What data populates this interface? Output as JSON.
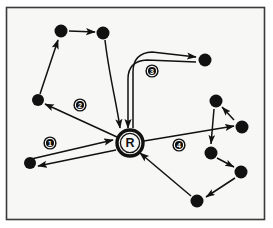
{
  "figure": {
    "type": "node-link-diagram",
    "background_color": "#f7f7f5",
    "border_color": "#3a3a3a",
    "stroke_color": "#111111",
    "node_fill": "#111111",
    "label_fill": "#111111",
    "label_text_color": "#ffffff",
    "width": 273,
    "height": 228
  },
  "depot": {
    "label": "R",
    "name": "depot-node",
    "x": 130,
    "y": 143,
    "outer_radius": 13,
    "inner_radius": 9.5
  },
  "route_labels": [
    {
      "id": "route-label-1",
      "text": "1",
      "x": 50,
      "y": 143
    },
    {
      "id": "route-label-2",
      "text": "2",
      "x": 80,
      "y": 105
    },
    {
      "id": "route-label-3",
      "text": "3",
      "x": 152,
      "y": 71
    },
    {
      "id": "route-label-4",
      "text": "4",
      "x": 179,
      "y": 145
    }
  ],
  "nodes": [
    {
      "id": "n1",
      "name": "customer-node-bottom-left",
      "x": 30,
      "y": 163,
      "r": 6.0,
      "route": 1
    },
    {
      "id": "n2",
      "name": "customer-node-left-middle",
      "x": 38,
      "y": 100,
      "r": 6.0,
      "route": 2
    },
    {
      "id": "n3",
      "name": "customer-node-top-left",
      "x": 61,
      "y": 31,
      "r": 6.5,
      "route": 2
    },
    {
      "id": "n4",
      "name": "customer-node-top-center",
      "x": 103,
      "y": 33,
      "r": 6.5,
      "route": 2
    },
    {
      "id": "n5",
      "name": "customer-node-right-top",
      "x": 205,
      "y": 60,
      "r": 6.5,
      "route": 3
    },
    {
      "id": "n6",
      "name": "customer-node-right-upper",
      "x": 216,
      "y": 101,
      "r": 6.5,
      "route": 4
    },
    {
      "id": "n7",
      "name": "customer-node-right-far",
      "x": 242,
      "y": 127,
      "r": 6.5,
      "route": 4
    },
    {
      "id": "n8",
      "name": "customer-node-right-mid",
      "x": 211,
      "y": 153,
      "r": 6.5,
      "route": 4
    },
    {
      "id": "n9",
      "name": "customer-node-right-lower",
      "x": 241,
      "y": 172,
      "r": 6.5,
      "route": 4
    },
    {
      "id": "n10",
      "name": "customer-node-bottom-right",
      "x": 197,
      "y": 201,
      "r": 6.5,
      "route": 4
    }
  ],
  "routes": [
    {
      "id": 1,
      "name": "route-1",
      "label": "1",
      "style": "single-line",
      "description": "Out-and-back leg between depot and bottom-left customer",
      "edges": [
        {
          "name": "edge-1-outbound",
          "from": "n1-area",
          "to": "depot",
          "x1": 27,
          "y1": 160,
          "x2": 113,
          "y2": 140,
          "arrow": "end"
        },
        {
          "name": "edge-1-return",
          "from": "depot",
          "to": "n1",
          "x1": 116,
          "y1": 150,
          "x2": 38,
          "y2": 166,
          "arrow": "end"
        }
      ]
    },
    {
      "id": 2,
      "name": "route-2",
      "label": "2",
      "style": "single-line",
      "description": "Depot to left-middle customer, up to top-left, right to top-center, back to depot",
      "edges": [
        {
          "name": "edge-2-depot-to-left",
          "from": "depot",
          "to": "n2",
          "x1": 117,
          "y1": 137,
          "x2": 45,
          "y2": 104,
          "arrow": "end"
        },
        {
          "name": "edge-2-left-to-topleft",
          "from": "n2",
          "to": "n3",
          "x1": 40,
          "y1": 94,
          "x2": 58,
          "y2": 39,
          "arrow": "end"
        },
        {
          "name": "edge-2-topleft-to-top",
          "from": "n3",
          "to": "n4",
          "x1": 69,
          "y1": 31,
          "x2": 95,
          "y2": 32,
          "arrow": "end"
        },
        {
          "name": "edge-2-top-to-depot",
          "from": "n4",
          "to": "depot",
          "x1": 106,
          "y1": 40,
          "x2": 120,
          "y2": 129,
          "arrow": "end"
        }
      ]
    },
    {
      "id": 3,
      "name": "route-3",
      "label": "3",
      "style": "double-line",
      "description": "Out-and-back loop from depot curving up and right to a single customer",
      "edges": [
        {
          "name": "edge-3-outbound",
          "from": "depot",
          "to": "n5",
          "arrow": "end"
        },
        {
          "name": "edge-3-return",
          "from": "n5",
          "to": "depot",
          "arrow": "end"
        }
      ]
    },
    {
      "id": 4,
      "name": "route-4",
      "label": "4",
      "style": "single-line",
      "description": "Depot to far-right customer then through right cluster and back to depot",
      "edges": [
        {
          "name": "edge-4-depot-to-far",
          "from": "depot",
          "to": "n7",
          "x1": 144,
          "y1": 141,
          "x2": 234,
          "y2": 125,
          "arrow": "end"
        },
        {
          "name": "edge-4-far-to-upper",
          "from": "n7",
          "to": "n6",
          "x1": 234,
          "y1": 119,
          "x2": 222,
          "y2": 106,
          "arrow": "end"
        },
        {
          "name": "edge-4-upper-to-mid",
          "from": "n6",
          "to": "n8",
          "x1": 214,
          "y1": 109,
          "x2": 211,
          "y2": 145,
          "arrow": "end"
        },
        {
          "name": "edge-4-mid-to-lower",
          "from": "n8",
          "to": "n9",
          "x1": 217,
          "y1": 158,
          "x2": 234,
          "y2": 168,
          "arrow": "end"
        },
        {
          "name": "edge-4-lower-to-bottom",
          "from": "n9",
          "to": "n10",
          "x1": 234,
          "y1": 177,
          "x2": 205,
          "y2": 198,
          "arrow": "end"
        },
        {
          "name": "edge-4-bottom-to-depot",
          "from": "n10",
          "to": "depot",
          "x1": 191,
          "y1": 196,
          "x2": 139,
          "y2": 153,
          "arrow": "end"
        }
      ]
    }
  ]
}
